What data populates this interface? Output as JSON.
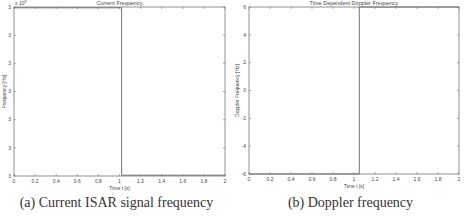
{
  "chart_data": [
    {
      "type": "line",
      "title": "Current Frequency",
      "xlabel": "Time t [s]",
      "ylabel": "Frequency [Hz]",
      "y_multiplier": "x 10^9",
      "x_ticks": [
        "0",
        "0.2",
        "0.4",
        "0.6",
        "0.8",
        "1",
        "1.2",
        "1.4",
        "1.6",
        "1.8",
        "2"
      ],
      "y_ticks": [
        "3",
        "3",
        "3",
        "3",
        "3",
        "3",
        "3"
      ],
      "xlim": [
        0,
        2
      ],
      "grid": false,
      "series": [
        {
          "name": "current frequency",
          "x": [
            0,
            1.02,
            1.02,
            2
          ],
          "y": [
            1.0,
            1.0,
            0.0,
            0.0
          ],
          "note": "normalized: high level then step down at ~1.02 s"
        }
      ],
      "caption": "(a) Current ISAR signal frequency"
    },
    {
      "type": "line",
      "title": "Time Dependent Doppler Frequency",
      "xlabel": "Time t [s]",
      "ylabel": "Doppler Frequency [Hz]",
      "x_ticks": [
        "0",
        "0.2",
        "0.4",
        "0.6",
        "0.8",
        "1",
        "1.2",
        "1.4",
        "1.6",
        "1.8",
        "2"
      ],
      "y_ticks": [
        "6",
        "4",
        "2",
        "0",
        "-2",
        "-4",
        "-6"
      ],
      "xlim": [
        0,
        2
      ],
      "ylim": [
        -6,
        6
      ],
      "grid": false,
      "series": [
        {
          "name": "doppler frequency",
          "x": [
            0,
            1.05,
            1.05,
            2
          ],
          "y": [
            -6,
            -6,
            6,
            6
          ]
        }
      ],
      "caption": "(b) Doppler frequency"
    }
  ],
  "panels": {
    "left": {
      "title": "Current Frequency",
      "xlabel": "Time t [s]",
      "ylabel": "Frequency [Hz]",
      "multiplier": "x 10",
      "multiplier_exp": "9",
      "caption": "(a) Current ISAR signal frequency"
    },
    "right": {
      "title": "Time Dependent Doppler Frequency",
      "xlabel": "Time t [s]",
      "ylabel": "Doppler Frequency [Hz]",
      "caption": "(b) Doppler frequency"
    }
  },
  "colors": {
    "axis": "#777777",
    "line": "#666666",
    "text": "#444444"
  }
}
